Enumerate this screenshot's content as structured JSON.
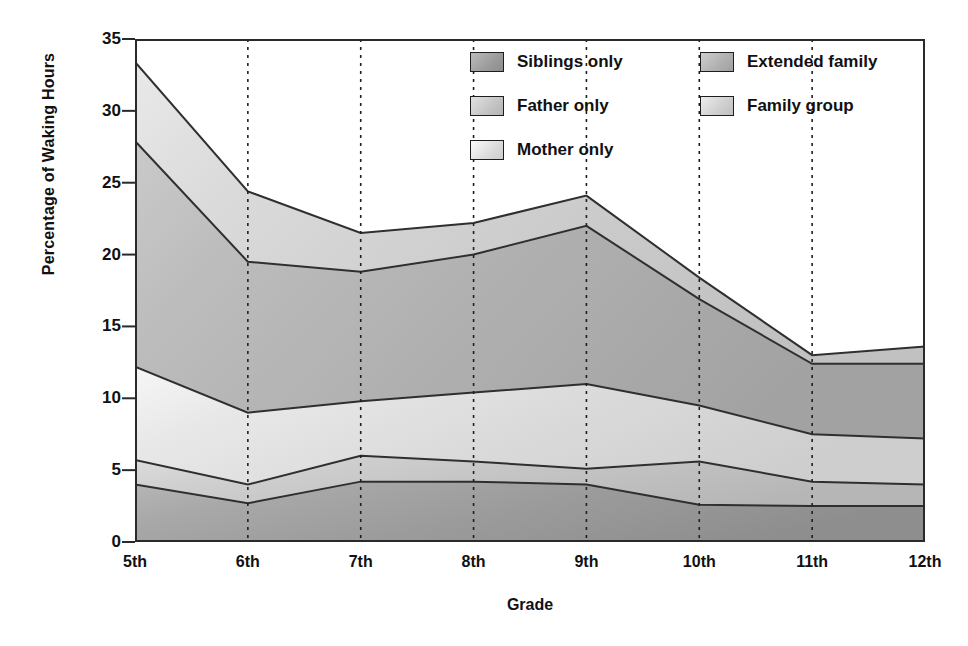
{
  "chart_data": {
    "type": "area",
    "stacked": true,
    "title": "",
    "xlabel": "Grade",
    "ylabel": "Percentage of Waking Hours",
    "categories": [
      "5th",
      "6th",
      "7th",
      "8th",
      "9th",
      "10th",
      "11th",
      "12th"
    ],
    "xtick_labels": [
      "5th",
      "6th",
      "7th",
      "8th",
      "9th",
      "10th",
      "11th",
      "12th"
    ],
    "ytick_labels": [
      "0",
      "5",
      "10",
      "15",
      "20",
      "25",
      "30",
      "35"
    ],
    "ytick_values": [
      0,
      5,
      10,
      15,
      20,
      25,
      30,
      35
    ],
    "ylim": [
      0,
      35
    ],
    "grid": "vertical-dotted",
    "legend_position": "top-right-inside",
    "cumulative_boundaries": {
      "family_group_top": [
        33.4,
        24.4,
        21.5,
        22.2,
        24.1,
        18.4,
        13.0,
        13.6
      ],
      "extended_family_top": [
        27.9,
        19.5,
        18.8,
        20.0,
        22.0,
        16.9,
        12.4,
        12.4
      ],
      "mother_only_top": [
        12.2,
        9.0,
        9.8,
        10.4,
        11.0,
        9.5,
        7.5,
        7.2
      ],
      "father_only_top": [
        5.7,
        4.0,
        6.0,
        5.6,
        5.1,
        5.6,
        4.2,
        4.0
      ],
      "siblings_only_top": [
        4.0,
        2.7,
        4.2,
        4.2,
        4.0,
        2.6,
        2.5,
        2.5
      ]
    },
    "series": [
      {
        "name": "Siblings only",
        "color": "#9c9c9c",
        "stack_order": 1,
        "values": [
          4.0,
          2.7,
          4.2,
          4.2,
          4.0,
          2.6,
          2.5,
          2.5
        ]
      },
      {
        "name": "Father only",
        "color": "#c4c4c4",
        "stack_order": 2,
        "values": [
          1.7,
          1.3,
          1.8,
          1.4,
          1.1,
          3.0,
          1.7,
          1.5
        ]
      },
      {
        "name": "Mother only",
        "color": "#dcdcdc",
        "stack_order": 3,
        "values": [
          6.5,
          5.0,
          3.8,
          4.8,
          5.9,
          3.9,
          3.3,
          3.2
        ]
      },
      {
        "name": "Extended family",
        "color": "#b0b0b0",
        "stack_order": 4,
        "values": [
          15.7,
          10.5,
          9.0,
          9.6,
          11.0,
          7.4,
          4.9,
          5.2
        ]
      },
      {
        "name": "Family group",
        "color": "#cfcfcf",
        "stack_order": 5,
        "values": [
          5.5,
          4.9,
          2.7,
          2.2,
          2.1,
          1.5,
          0.6,
          1.2
        ]
      }
    ]
  },
  "legend": {
    "entries": [
      {
        "label": "Siblings only",
        "column": 0,
        "row": 0
      },
      {
        "label": "Father only",
        "column": 0,
        "row": 1
      },
      {
        "label": "Mother only",
        "column": 0,
        "row": 2
      },
      {
        "label": "Extended family",
        "column": 1,
        "row": 0
      },
      {
        "label": "Family group",
        "column": 1,
        "row": 1
      }
    ]
  },
  "colors": {
    "siblings_only": "#9c9c9c",
    "father_only": "#c4c4c4",
    "mother_only": "#dcdcdc",
    "extended_family": "#b0b0b0",
    "family_group": "#cfcfcf",
    "axis": "#2a2a2a",
    "line": "#2f2f2f",
    "background": "#ffffff"
  }
}
